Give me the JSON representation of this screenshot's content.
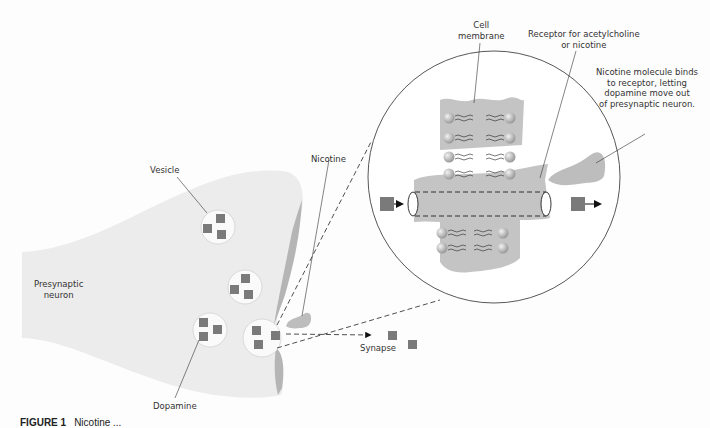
{
  "labels": {
    "vesicle": "Vesicle",
    "presynaptic_neuron_line1": "Presynaptic",
    "presynaptic_neuron_line2": "neuron",
    "dopamine": "Dopamine",
    "nicotine": "Nicotine",
    "synapse": "Synapse",
    "cell_membrane_line1": "Cell",
    "cell_membrane_line2": "membrane",
    "receptor_line1": "Receptor for acetylcholine",
    "receptor_line2": "or nicotine",
    "binding_line1": "Nicotine molecule binds",
    "binding_line2": "to receptor, letting",
    "binding_line3": "dopamine move out",
    "binding_line4": "of presynaptic neuron."
  },
  "caption": {
    "figure_label": "FIGURE 1",
    "text": "Nicotine ..."
  },
  "colors": {
    "background": "#fdfdfd",
    "neuron_fill": "#ececec",
    "neuron_edge": "#b5b5b5",
    "dopamine": "#7a7a7a",
    "membrane": "#c4c4c4",
    "nicotine": "#bdbdbd",
    "line": "#444444"
  }
}
